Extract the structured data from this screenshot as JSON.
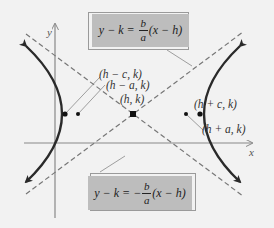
{
  "diagram": {
    "type": "hyperbola-horizontal-transverse-axis",
    "axes": {
      "x_label": "x",
      "y_label": "y"
    },
    "points": [
      {
        "id": "focus-left",
        "label": "(h − c, k)"
      },
      {
        "id": "vertex-left",
        "label": "(h − a, k)"
      },
      {
        "id": "center",
        "label": "(h, k)"
      },
      {
        "id": "focus-right",
        "label": "(h + c, k)"
      },
      {
        "id": "vertex-right",
        "label": "(h + a, k)"
      }
    ],
    "asymptotes": {
      "upper": {
        "lhs": "y − k =",
        "sign": "",
        "num": "b",
        "den": "a",
        "rhs": "(x − h)"
      },
      "lower": {
        "lhs": "y − k =",
        "sign": "−",
        "num": "b",
        "den": "a",
        "rhs": "(x − h)"
      }
    },
    "colors": {
      "background": "#f2f2f2",
      "curve": "#2a2a2a",
      "asymptote": "#777777",
      "box": "#bdbdbd",
      "axis": "#888888"
    }
  }
}
